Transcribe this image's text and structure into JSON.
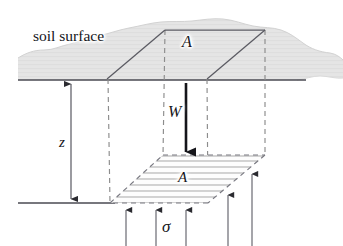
{
  "figure": {
    "type": "geotechnical-soil-element-diagram",
    "background_color": "#ffffff",
    "ink_color": "#15151a",
    "soil_band_color": "#e3e3e3",
    "hatch_color": "#9a9a9a",
    "dash_color": "#8c8c8c"
  },
  "labels": {
    "soil_surface": "soil surface",
    "area_top": "A",
    "area_bottom": "A",
    "weight": "W",
    "depth": "z",
    "stress": "σ"
  },
  "geometry": {
    "ground_line": {
      "x1": 18,
      "y1": 80,
      "x2": 306,
      "y2": 80
    },
    "base_line": {
      "x1": 18,
      "y1": 203,
      "x2": 115,
      "y2": 203
    },
    "top_face": [
      [
        107,
        79
      ],
      [
        165,
        30
      ],
      [
        265,
        30
      ],
      [
        207,
        79
      ]
    ],
    "bottom_face": [
      [
        110,
        203
      ],
      [
        163,
        155
      ],
      [
        265,
        155
      ],
      [
        208,
        203
      ]
    ],
    "depth_arrow": {
      "x": 71,
      "y_top": 82,
      "y_bottom": 201
    },
    "weight_arrow": {
      "x": 186,
      "y_top": 83,
      "y_bottom": 156
    },
    "stress_arrows": [
      {
        "x": 126,
        "y_tip": 207,
        "y_base": 246
      },
      {
        "x": 156,
        "y_tip": 207,
        "y_base": 246
      },
      {
        "x": 186,
        "y_tip": 207,
        "y_base": 246
      },
      {
        "x": 228,
        "y_tip": 192,
        "y_base": 246
      },
      {
        "x": 252,
        "y_tip": 171,
        "y_base": 246
      }
    ],
    "hatch_line_count": 8
  }
}
